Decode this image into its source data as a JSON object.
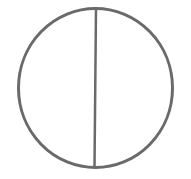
{
  "diagram": {
    "shape": "circle-divided-vertically",
    "stroke_color": "#6a6a6a",
    "background": "#ffffff",
    "circle": {
      "cx": 95.5,
      "cy": 88,
      "rx": 77,
      "ry": 79.5
    },
    "divider": {
      "x1": 96,
      "y1": 8.5,
      "x2": 94.5,
      "y2": 167
    }
  }
}
